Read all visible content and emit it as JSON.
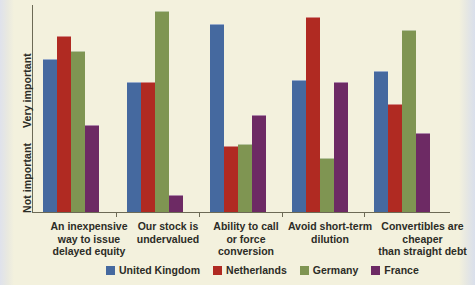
{
  "chart_data": {
    "type": "bar",
    "title": "",
    "xlabel": "",
    "ylabel": "",
    "grid": false,
    "legend_position": "bottom",
    "y_axis": {
      "top_label": "Very important",
      "bottom_label": "Not important",
      "ylim": [
        0,
        100
      ],
      "qualitative": true,
      "ticks": []
    },
    "categories": [
      "An inexpensive way to issue delayed equity",
      "Our stock is undervalued",
      "Ability to call or force conversion",
      "Avoid short-term dilution",
      "Convertibles are cheaper than straight debt"
    ],
    "category_lines": [
      [
        "An inexpensive",
        "way to issue",
        "delayed equity"
      ],
      [
        "Our stock is",
        "undervalued"
      ],
      [
        "Ability to call",
        "or force",
        "conversion"
      ],
      [
        "Avoid short-term",
        "dilution"
      ],
      [
        "Convertibles  are",
        "cheaper",
        "than straight debt"
      ]
    ],
    "series": [
      {
        "name": "United Kingdom",
        "color": "#45699f",
        "values": [
          74,
          63,
          91,
          64,
          68
        ]
      },
      {
        "name": "Netherlands",
        "color": "#b02a22",
        "values": [
          85,
          63,
          32,
          94,
          52
        ]
      },
      {
        "name": "Germany",
        "color": "#7f9552",
        "values": [
          78,
          97,
          33,
          26,
          88
        ]
      },
      {
        "name": "France",
        "color": "#6d2a64",
        "values": [
          42,
          8,
          47,
          63,
          38
        ]
      }
    ]
  },
  "legend": {
    "items": [
      {
        "label": "United Kingdom",
        "color": "#45699f"
      },
      {
        "label": "Netherlands",
        "color": "#b02a22"
      },
      {
        "label": "Germany",
        "color": "#7f9552"
      },
      {
        "label": "France",
        "color": "#6d2a64"
      }
    ]
  }
}
